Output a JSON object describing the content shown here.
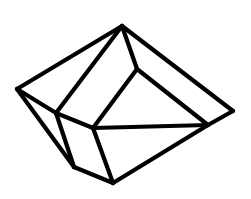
{
  "diagram": {
    "type": "polyhedron-line-drawing",
    "stroke_color": "#000000",
    "background": "#ffffff",
    "stroke_width": 4.2,
    "vertices": {
      "apex": [
        122,
        26
      ],
      "left": [
        17,
        89
      ],
      "inner_upper": [
        137,
        69
      ],
      "right": [
        233,
        111
      ],
      "right_inner": [
        208,
        125
      ],
      "left_inner": [
        56,
        113
      ],
      "center": [
        93,
        128
      ],
      "bottom_left": [
        74,
        167
      ],
      "bottom": [
        113,
        183
      ]
    },
    "edges": [
      [
        "apex",
        "left"
      ],
      [
        "apex",
        "left_inner"
      ],
      [
        "apex",
        "inner_upper"
      ],
      [
        "apex",
        "right"
      ],
      [
        "inner_upper",
        "center"
      ],
      [
        "inner_upper",
        "right_inner"
      ],
      [
        "right",
        "right_inner"
      ],
      [
        "left",
        "left_inner"
      ],
      [
        "left",
        "bottom_left"
      ],
      [
        "left_inner",
        "center"
      ],
      [
        "left_inner",
        "bottom_left"
      ],
      [
        "center",
        "right_inner"
      ],
      [
        "center",
        "bottom"
      ],
      [
        "bottom_left",
        "bottom"
      ],
      [
        "right_inner",
        "bottom"
      ]
    ]
  }
}
